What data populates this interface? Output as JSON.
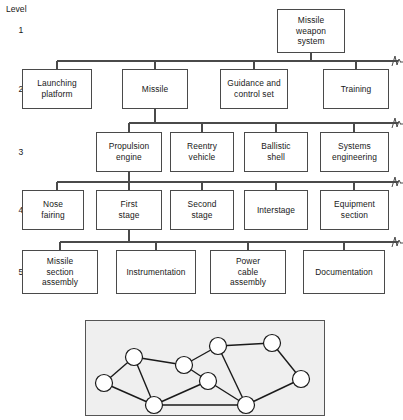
{
  "figure": {
    "level_heading": "Level",
    "levels": [
      {
        "number": "1",
        "y": 30
      },
      {
        "number": "2",
        "y": 89
      },
      {
        "number": "3",
        "y": 152
      },
      {
        "number": "4",
        "y": 210
      },
      {
        "number": "5",
        "y": 272
      }
    ],
    "rows": [
      {
        "level": "1",
        "boxes": [
          {
            "label": "Missile\nweapon\nsystem",
            "x": 277,
            "y": 9,
            "w": 68,
            "h": 44
          }
        ]
      },
      {
        "level": "2",
        "boxes": [
          {
            "label": "Launching\nplatform",
            "x": 22,
            "y": 69,
            "w": 70,
            "h": 40
          },
          {
            "label": "Missile",
            "x": 122,
            "y": 69,
            "w": 66,
            "h": 40
          },
          {
            "label": "Guidance and\ncontrol set",
            "x": 220,
            "y": 69,
            "w": 68,
            "h": 40
          },
          {
            "label": "Training",
            "x": 323,
            "y": 69,
            "w": 66,
            "h": 40
          }
        ]
      },
      {
        "level": "3",
        "boxes": [
          {
            "label": "Propulsion\nengine",
            "x": 96,
            "y": 132,
            "w": 66,
            "h": 40
          },
          {
            "label": "Reentry\nvehicle",
            "x": 170,
            "y": 132,
            "w": 64,
            "h": 40
          },
          {
            "label": "Ballistic\nshell",
            "x": 244,
            "y": 132,
            "w": 64,
            "h": 40
          },
          {
            "label": "Systems\nengineering",
            "x": 320,
            "y": 132,
            "w": 69,
            "h": 40
          }
        ]
      },
      {
        "level": "4",
        "boxes": [
          {
            "label": "Nose\nfairing",
            "x": 22,
            "y": 190,
            "w": 62,
            "h": 40
          },
          {
            "label": "First\nstage",
            "x": 96,
            "y": 190,
            "w": 66,
            "h": 40
          },
          {
            "label": "Second\nstage",
            "x": 170,
            "y": 190,
            "w": 64,
            "h": 40
          },
          {
            "label": "Interstage",
            "x": 244,
            "y": 190,
            "w": 64,
            "h": 40
          },
          {
            "label": "Equipment\nsection",
            "x": 320,
            "y": 190,
            "w": 69,
            "h": 40
          }
        ]
      },
      {
        "level": "5",
        "boxes": [
          {
            "label": "Missile\nsection\nassembly",
            "x": 22,
            "y": 250,
            "w": 76,
            "h": 44
          },
          {
            "label": "Instrumentation",
            "x": 116,
            "y": 250,
            "w": 80,
            "h": 44
          },
          {
            "label": "Power\ncable\nassembly",
            "x": 210,
            "y": 250,
            "w": 76,
            "h": 44
          },
          {
            "label": "Documentation",
            "x": 303,
            "y": 250,
            "w": 82,
            "h": 44
          }
        ]
      }
    ],
    "connectors": {
      "buses": [
        {
          "y": 61,
          "x1": 57,
          "x2": 390,
          "stub_to": 398,
          "parent_x": 311,
          "parent_y": 53,
          "children_x": [
            57,
            155,
            254,
            356
          ]
        },
        {
          "y": 123,
          "x1": 129,
          "x2": 390,
          "stub_to": 398,
          "parent_x": 155,
          "parent_y": 109,
          "children_x": [
            129,
            202,
            276,
            354
          ]
        },
        {
          "y": 182,
          "x1": 57,
          "x2": 390,
          "stub_to": 398,
          "parent_x": 129,
          "parent_y": 172,
          "children_x": [
            57,
            129,
            202,
            276,
            354
          ]
        },
        {
          "y": 242,
          "x1": 60,
          "x2": 390,
          "stub_to": 398,
          "parent_x": 129,
          "parent_y": 230,
          "children_x": [
            60,
            156,
            248,
            344
          ]
        }
      ],
      "break_marks": [
        61,
        123,
        182,
        242
      ]
    }
  },
  "network_graph": {
    "panel": {
      "x": 85,
      "y": 320,
      "w": 240,
      "h": 96
    },
    "background_color": "#efefef",
    "border_color": "#555555",
    "node_fill": "#ffffff",
    "node_stroke": "#1a1a1a",
    "edge_color": "#1a1a1a",
    "node_radius": 8.5,
    "nodes": [
      {
        "id": "n1",
        "x": 48,
        "y": 36
      },
      {
        "id": "n2",
        "x": 18,
        "y": 62
      },
      {
        "id": "n3",
        "x": 98,
        "y": 44
      },
      {
        "id": "n4",
        "x": 132,
        "y": 25
      },
      {
        "id": "n5",
        "x": 186,
        "y": 22
      },
      {
        "id": "n6",
        "x": 122,
        "y": 60
      },
      {
        "id": "n7",
        "x": 215,
        "y": 58
      },
      {
        "id": "n8",
        "x": 68,
        "y": 84
      },
      {
        "id": "n9",
        "x": 160,
        "y": 84
      }
    ],
    "edges": [
      [
        "n1",
        "n2"
      ],
      [
        "n1",
        "n3"
      ],
      [
        "n1",
        "n8"
      ],
      [
        "n2",
        "n8"
      ],
      [
        "n3",
        "n4"
      ],
      [
        "n3",
        "n6"
      ],
      [
        "n4",
        "n5"
      ],
      [
        "n4",
        "n9"
      ],
      [
        "n5",
        "n7"
      ],
      [
        "n6",
        "n8"
      ],
      [
        "n6",
        "n9"
      ],
      [
        "n7",
        "n9"
      ],
      [
        "n8",
        "n9"
      ]
    ]
  }
}
